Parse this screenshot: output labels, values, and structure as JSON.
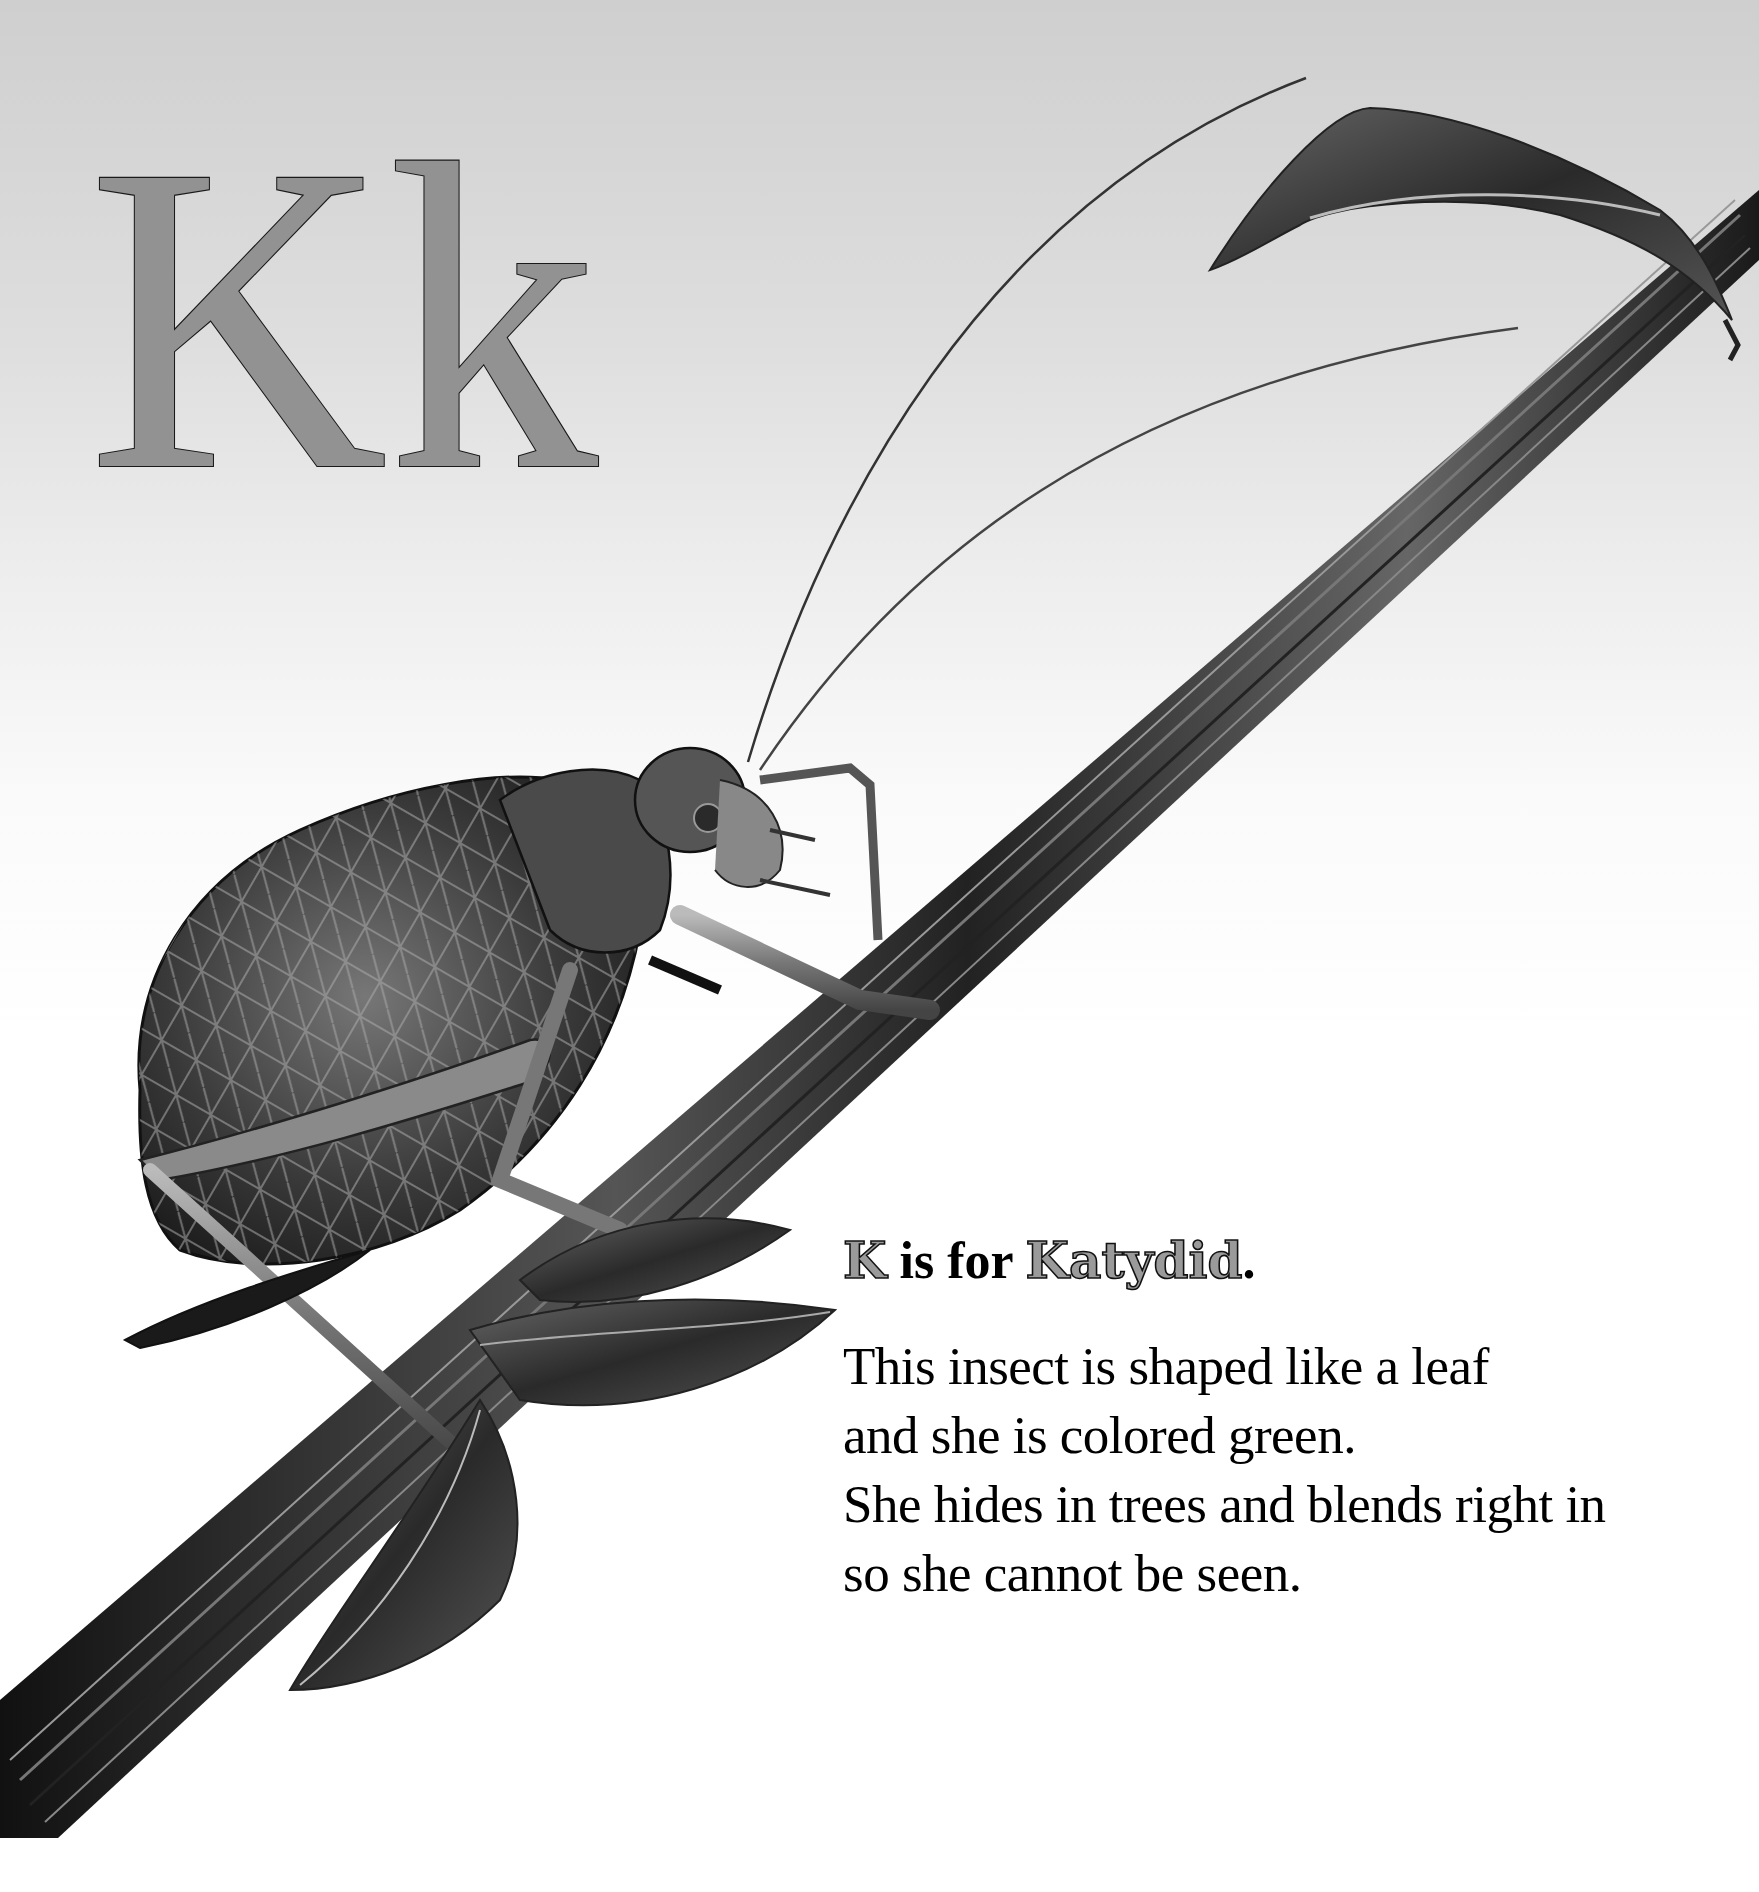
{
  "page": {
    "background_top": "#cfcfcf",
    "background_bottom": "#ffffff"
  },
  "heading": {
    "uppercase": "K",
    "lowercase": "k",
    "fill_color": "#929292",
    "outline_color": "#1a1a1a"
  },
  "illustration": {
    "subject": "katydid on plant stem",
    "elements": [
      "katydid",
      "stem",
      "curled-leaf-top",
      "leaves-bottom",
      "antennae"
    ]
  },
  "caption": {
    "headline": {
      "letter": "K",
      "connector": " is for ",
      "word": "Katydid",
      "punctuation": "."
    },
    "verse": [
      "This insect is shaped like a leaf",
      "and she is colored green.",
      "She hides in trees and blends right in",
      "so she cannot be seen."
    ]
  }
}
